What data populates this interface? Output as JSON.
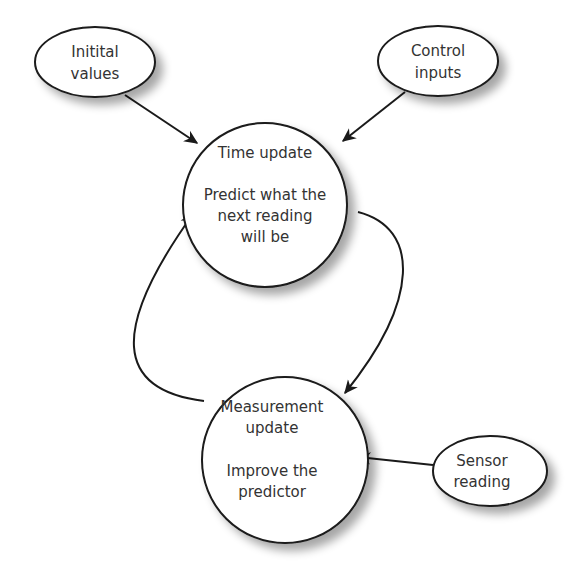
{
  "diagram": {
    "colors": {
      "stroke": "#1a1a1a",
      "fill": "#ffffff",
      "text": "#333333",
      "shadow": "#bbbbbb"
    },
    "nodes": {
      "initial_values": {
        "lines": [
          "Initital",
          "values"
        ]
      },
      "control_inputs": {
        "lines": [
          "Control",
          "inputs"
        ]
      },
      "time_update": {
        "lines": [
          "Time update",
          "",
          "Predict what the",
          "next reading",
          "will be"
        ]
      },
      "measurement_update": {
        "lines": [
          "Measurement",
          "update",
          "",
          "Improve the",
          "predictor"
        ]
      },
      "sensor_reading": {
        "lines": [
          "Sensor",
          "reading"
        ]
      }
    },
    "edges": [
      {
        "from": "initial_values",
        "to": "time_update"
      },
      {
        "from": "control_inputs",
        "to": "time_update"
      },
      {
        "from": "time_update",
        "to": "measurement_update"
      },
      {
        "from": "measurement_update",
        "to": "time_update"
      },
      {
        "from": "sensor_reading",
        "to": "measurement_update"
      }
    ]
  }
}
